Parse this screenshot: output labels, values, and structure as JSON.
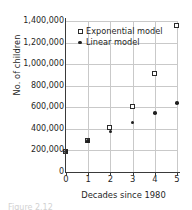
{
  "figure": {
    "caption_partial": "Figure 2.12"
  },
  "legend": {
    "position": "top-left-inside",
    "entries": [
      {
        "label": "Exponential model",
        "marker": "open-square-marker"
      },
      {
        "label": "Linear model",
        "marker": "filled-circle-marker"
      }
    ]
  },
  "axes": {
    "ylabel": "No. of children",
    "xlabel": "Decades since 1980",
    "yticks": [
      "0",
      "200,000",
      "400,000",
      "600,000",
      "800,000",
      "1,000,000",
      "1,200,000",
      "1,400,000"
    ],
    "xticks": [
      "0",
      "1",
      "2",
      "3",
      "4",
      "5"
    ]
  },
  "colors": {
    "grid": "#c9c9c9",
    "axis": "#3a3a3a",
    "marker_exponential_edge": "#2b2b2b",
    "marker_exponential_fill": "#ffffff",
    "marker_linear_fill": "#202020",
    "text": "#1f1f1f",
    "background": "#ffffff"
  },
  "chart_data": {
    "type": "scatter",
    "title": "",
    "xlabel": "Decades since 1980",
    "ylabel": "No. of children",
    "xlim": [
      0,
      5
    ],
    "ylim": [
      0,
      1400000
    ],
    "xticks": [
      0,
      1,
      2,
      3,
      4,
      5
    ],
    "yticks": [
      0,
      200000,
      400000,
      600000,
      800000,
      1000000,
      1200000,
      1400000
    ],
    "grid": true,
    "legend_position": "upper left",
    "x": [
      0,
      1,
      2,
      3,
      4,
      5
    ],
    "series": [
      {
        "name": "Exponential model",
        "marker": "open square",
        "values": [
          190000,
          285000,
          410000,
          605000,
          910000,
          1355000
        ]
      },
      {
        "name": "Linear model",
        "marker": "filled circle",
        "values": [
          190000,
          285000,
          375000,
          460000,
          548000,
          637000
        ]
      }
    ]
  }
}
